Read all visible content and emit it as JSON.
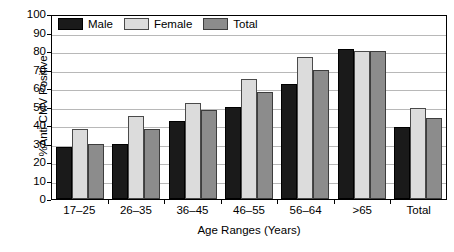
{
  "chart_data": {
    "type": "bar",
    "title": "",
    "xlabel": "Age Ranges (Years)",
    "ylabel": "%Anti-CMV Positive",
    "categories": [
      "17–25",
      "26–35",
      "36–45",
      "46–55",
      "56–64",
      ">65",
      "Total"
    ],
    "series": [
      {
        "name": "Male",
        "color": "#1a1a1a",
        "values": [
          28,
          30,
          42,
          50,
          62,
          81,
          39
        ]
      },
      {
        "name": "Female",
        "color": "#dcdcdc",
        "values": [
          38,
          45,
          52,
          65,
          77,
          80,
          49
        ]
      },
      {
        "name": "Total",
        "color": "#8c8c8c",
        "values": [
          30,
          38,
          48,
          58,
          70,
          80,
          44
        ]
      }
    ],
    "ylim": [
      0,
      100
    ],
    "yticks": [
      0,
      10,
      20,
      30,
      40,
      50,
      60,
      70,
      80,
      90,
      100
    ],
    "ytick_labels": [
      "0",
      "10",
      "20",
      "30",
      "40",
      "50",
      "60",
      "70",
      "80",
      "90",
      "100"
    ],
    "grid": true,
    "legend_position": "top-left"
  },
  "legend": {
    "entries": [
      {
        "label": "Male"
      },
      {
        "label": "Female"
      },
      {
        "label": "Total"
      }
    ]
  }
}
